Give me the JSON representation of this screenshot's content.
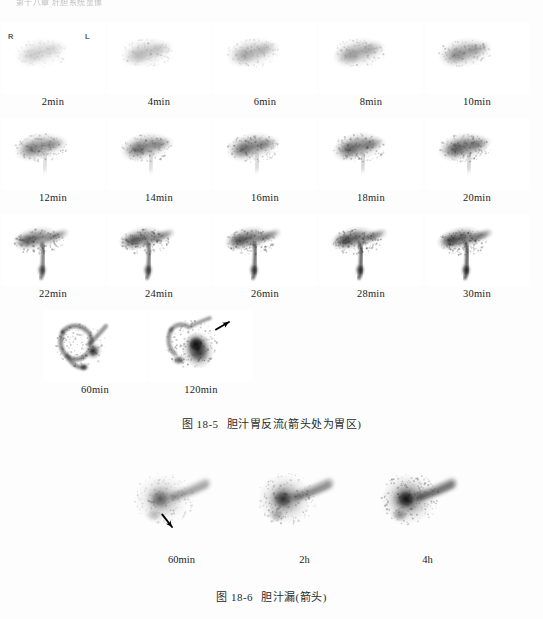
{
  "page": {
    "running_header": "第十八章 肝胆系统显像",
    "background_color": "#fdfdfd",
    "text_color": "#1c1c1c"
  },
  "orientation": {
    "right_marker": "R",
    "left_marker": "L"
  },
  "figure_1": {
    "caption_number": "图 18-5",
    "caption_text": "胆汁胃反流(箭头处为胃区)",
    "rows": [
      {
        "frames": [
          {
            "label": "2min",
            "intensity": 0.18,
            "pattern": "liver-only"
          },
          {
            "label": "4min",
            "intensity": 0.26,
            "pattern": "liver-only"
          },
          {
            "label": "6min",
            "intensity": 0.32,
            "pattern": "liver-only"
          },
          {
            "label": "8min",
            "intensity": 0.38,
            "pattern": "liver-only"
          },
          {
            "label": "10min",
            "intensity": 0.44,
            "pattern": "liver-only"
          }
        ]
      },
      {
        "frames": [
          {
            "label": "12min",
            "intensity": 0.5,
            "pattern": "liver-duct"
          },
          {
            "label": "14min",
            "intensity": 0.55,
            "pattern": "liver-duct"
          },
          {
            "label": "16min",
            "intensity": 0.58,
            "pattern": "liver-duct"
          },
          {
            "label": "18min",
            "intensity": 0.62,
            "pattern": "liver-duct"
          },
          {
            "label": "20min",
            "intensity": 0.66,
            "pattern": "liver-duct"
          }
        ]
      },
      {
        "frames": [
          {
            "label": "22min",
            "intensity": 0.7,
            "pattern": "duct-drain"
          },
          {
            "label": "24min",
            "intensity": 0.74,
            "pattern": "duct-drain"
          },
          {
            "label": "26min",
            "intensity": 0.78,
            "pattern": "duct-drain"
          },
          {
            "label": "28min",
            "intensity": 0.82,
            "pattern": "duct-drain"
          },
          {
            "label": "30min",
            "intensity": 0.86,
            "pattern": "duct-drain"
          }
        ]
      },
      {
        "frames": [
          {
            "label": "60min",
            "intensity": 0.92,
            "pattern": "biliary-tree",
            "arrow": false
          },
          {
            "label": "120min",
            "intensity": 1.0,
            "pattern": "reflux-stomach",
            "arrow": true
          }
        ]
      }
    ]
  },
  "figure_2": {
    "caption_number": "图 18-6",
    "caption_text": "胆汁漏(箭头)",
    "frames": [
      {
        "label": "60min",
        "intensity": 0.55,
        "arrow": true
      },
      {
        "label": "2h",
        "intensity": 0.78,
        "arrow": false
      },
      {
        "label": "4h",
        "intensity": 1.0,
        "arrow": false
      }
    ]
  },
  "colors": {
    "ink": "#1c1c1c",
    "scan_dark": "#101010",
    "scan_mid": "#6f6f6f",
    "paper": "#ffffff",
    "arrow": "#000000"
  }
}
